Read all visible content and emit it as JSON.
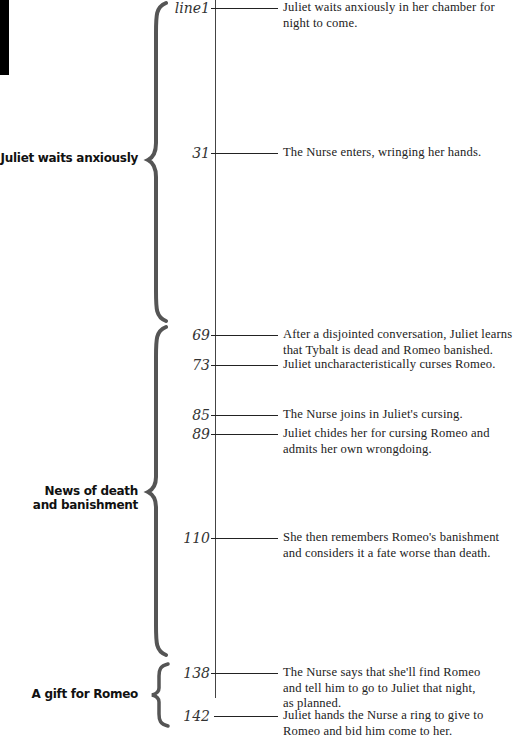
{
  "diagram": {
    "axis_color": "#444444",
    "brace_color": "#555555",
    "sections": [
      {
        "label": "Juliet waits anxiously",
        "brace_top": 3,
        "brace_bottom": 320,
        "brace_point": 160
      },
      {
        "label": "News of death\nand banishment",
        "label_line1": "News of death",
        "label_line2": "and banishment",
        "brace_top": 327,
        "brace_bottom": 655,
        "brace_point": 492
      },
      {
        "label": "A gift for Romeo",
        "brace_top": 664,
        "brace_bottom": 726,
        "brace_point": 695
      }
    ],
    "events": [
      {
        "line": "line1",
        "y": 8,
        "text_line1": "Juliet waits anxiously in her chamber for",
        "text_line2": "night to come."
      },
      {
        "line": "31",
        "y": 153,
        "text_line1": "The Nurse enters, wringing her hands."
      },
      {
        "line": "69",
        "y": 335,
        "text_line1": "After a disjointed conversation, Juliet learns",
        "text_line2": "that Tybalt is dead and Romeo banished."
      },
      {
        "line": "73",
        "y": 365,
        "text_line1": "Juliet uncharacteristically curses Romeo."
      },
      {
        "line": "85",
        "y": 415,
        "text_line1": "The Nurse joins in Juliet's cursing."
      },
      {
        "line": "89",
        "y": 434,
        "text_line1": "Juliet chides her for cursing Romeo and",
        "text_line2": "admits her own wrongdoing."
      },
      {
        "line": "110",
        "y": 538,
        "text_line1": "She then remembers Romeo's banishment",
        "text_line2": "and considers it a fate worse than death."
      },
      {
        "line": "138",
        "y": 673,
        "text_line1": "The Nurse says that she'll find Romeo",
        "text_line2": "and tell him to go to Juliet that night,",
        "text_line3": "as planned."
      },
      {
        "line": "142",
        "y": 716,
        "text_line1": "Juliet hands the Nurse a ring to give to",
        "text_line2": "Romeo and bid him come to her."
      }
    ]
  }
}
